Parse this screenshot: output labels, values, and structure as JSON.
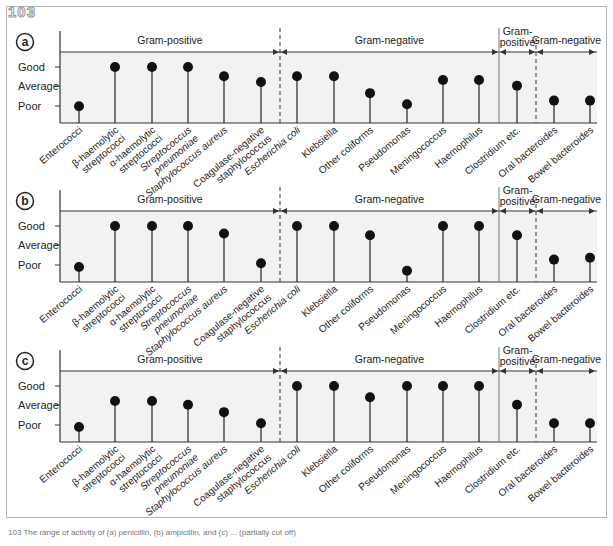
{
  "figure": {
    "number": "103",
    "caption": "103 The range of activity of (a) penicillin, (b) ampicillin, and (c) ... (partially cut off)"
  },
  "styles": {
    "panel_bg": "#f2f2f2",
    "line_color": "#333333",
    "dot_color": "#111111",
    "text_color": "#222222"
  },
  "chart_data": [
    {
      "type": "lollipop",
      "panel": "a",
      "ylabel_ticks": [
        "Poor",
        "Average",
        "Good"
      ],
      "ylim": [
        0,
        3.4
      ],
      "groups": [
        {
          "label": "Gram-positive",
          "from": 0,
          "to": 5
        },
        {
          "label": "Gram-negative",
          "from": 6,
          "to": 11
        },
        {
          "label": "Gram-positive",
          "label_line1": "Gram-",
          "label_line2": "positive",
          "from": 12,
          "to": 12
        },
        {
          "label": "Gram-negative",
          "from": 13,
          "to": 14
        }
      ],
      "categories": [
        "Enterococci",
        "β-haemolytic streptococci",
        "α-haemolytic streptococci",
        "Streptococcus pneumoniae",
        "Staphylococcus aureus",
        "Coagulase-negative staphylococcus",
        "Escherichia coli",
        "Klebsiella",
        "Other coliforms",
        "Pseudomonas",
        "Meningococcus",
        "Haemophilus",
        "Clostridium etc.",
        "Oral bacteroides",
        "Bowel bacteroides"
      ],
      "values": [
        0.9,
        3.0,
        3.0,
        3.0,
        2.5,
        2.2,
        2.5,
        2.5,
        1.6,
        1.0,
        2.3,
        2.3,
        2.0,
        1.2,
        1.2
      ]
    },
    {
      "type": "lollipop",
      "panel": "b",
      "ylabel_ticks": [
        "Poor",
        "Average",
        "Good"
      ],
      "ylim": [
        0,
        3.4
      ],
      "groups": [
        {
          "label": "Gram-positive",
          "from": 0,
          "to": 5
        },
        {
          "label": "Gram-negative",
          "from": 6,
          "to": 11
        },
        {
          "label": "Gram-positive",
          "label_line1": "Gram-",
          "label_line2": "positive",
          "from": 12,
          "to": 12
        },
        {
          "label": "Gram-negative",
          "from": 13,
          "to": 14
        }
      ],
      "categories": [
        "Enterococci",
        "β-haemolytic streptococci",
        "α-haemolytic streptococci",
        "Streptococcus pneumoniae",
        "Staphylococcus aureus",
        "Coagulase-negative staphylococcus",
        "Escherichia coli",
        "Klebsiella",
        "Other coliforms",
        "Pseudomonas",
        "Meningococcus",
        "Haemophilus",
        "Clostridium etc.",
        "Oral bacteroides",
        "Bowel bacteroides"
      ],
      "values": [
        0.8,
        3.0,
        3.0,
        3.0,
        2.6,
        1.0,
        3.0,
        3.0,
        2.5,
        0.6,
        3.0,
        3.0,
        2.5,
        1.2,
        1.3
      ]
    },
    {
      "type": "lollipop",
      "panel": "c",
      "ylabel_ticks": [
        "Poor",
        "Average",
        "Good"
      ],
      "ylim": [
        0,
        3.4
      ],
      "groups": [
        {
          "label": "Gram-positive",
          "from": 0,
          "to": 5
        },
        {
          "label": "Gram-negative",
          "from": 6,
          "to": 11
        },
        {
          "label": "Gram-positive",
          "label_line1": "Gram-",
          "label_line2": "positive",
          "from": 12,
          "to": 12
        },
        {
          "label": "Gram-negative",
          "from": 13,
          "to": 14
        }
      ],
      "categories": [
        "Enterococci",
        "β-haemolytic streptococci",
        "α-haemolytic streptococci",
        "Streptococcus pneumoniae",
        "Staphylococcus aureus",
        "Coagulase-negative staphylococcus",
        "Escherichia coli",
        "Klebsiella",
        "Other coliforms",
        "Pseudomonas",
        "Meningococcus",
        "Haemophilus",
        "Clostridium etc.",
        "Oral bacteroides",
        "Bowel bacteroides"
      ],
      "values": [
        0.8,
        2.2,
        2.2,
        2.0,
        1.6,
        1.0,
        3.0,
        3.0,
        2.4,
        3.0,
        3.0,
        3.0,
        2.0,
        1.0,
        1.0
      ]
    }
  ],
  "x_labels": [
    {
      "lines": [
        "Enterococci"
      ],
      "italic": false
    },
    {
      "lines": [
        "β-haemolytic",
        "streptococci"
      ],
      "italic": false
    },
    {
      "lines": [
        "α-haemolytic",
        "streptococci"
      ],
      "italic": false
    },
    {
      "lines": [
        "Streptococcus",
        "pneumoniae"
      ],
      "italic": true
    },
    {
      "lines": [
        "Staphylococcus aureus"
      ],
      "italic": true
    },
    {
      "lines": [
        "Coagulase-negative",
        "staphylococcus"
      ],
      "italic": false
    },
    {
      "lines": [
        "Escherichia coli"
      ],
      "italic": true
    },
    {
      "lines": [
        "Klebsiella"
      ],
      "italic": false
    },
    {
      "lines": [
        "Other coliforms"
      ],
      "italic": false
    },
    {
      "lines": [
        "Pseudomonas"
      ],
      "italic": false
    },
    {
      "lines": [
        "Meningococcus"
      ],
      "italic": false
    },
    {
      "lines": [
        "Haemophilus"
      ],
      "italic": false
    },
    {
      "lines": [
        "Clostridium etc."
      ],
      "italic": false
    },
    {
      "lines": [
        "Oral bacteroides"
      ],
      "italic": false
    },
    {
      "lines": [
        "Bowel bacteroides"
      ],
      "italic": false
    }
  ]
}
